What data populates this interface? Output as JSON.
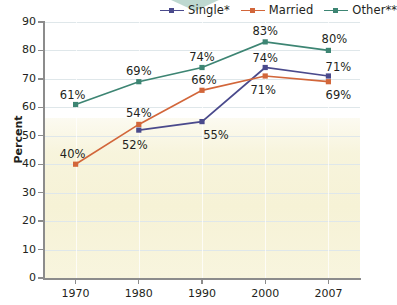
{
  "chart_data": {
    "type": "line",
    "title": "",
    "xlabel": "",
    "ylabel": "Percent",
    "categories": [
      "1970",
      "1980",
      "1990",
      "2000",
      "2007"
    ],
    "ylim": [
      0,
      90
    ],
    "ytick_step": 10,
    "yticks": [
      "0",
      "10",
      "20",
      "30",
      "40",
      "50",
      "60",
      "70",
      "80",
      "90"
    ],
    "grid": true,
    "legend_position": "top",
    "series": [
      {
        "name": "Single*",
        "color": "#4a4a8c",
        "marker": "square",
        "values": [
          null,
          52,
          55,
          74,
          71
        ],
        "labels": [
          "",
          "52%",
          "55%",
          "74%",
          "71%"
        ]
      },
      {
        "name": "Married",
        "color": "#d2663a",
        "marker": "square",
        "values": [
          40,
          54,
          66,
          71,
          69
        ],
        "labels": [
          "40%",
          "54%",
          "66%",
          "71%",
          "69%"
        ]
      },
      {
        "name": "Other**",
        "color": "#3d8573",
        "marker": "square",
        "values": [
          61,
          69,
          74,
          83,
          80
        ],
        "labels": [
          "61%",
          "69%",
          "74%",
          "83%",
          "80%"
        ]
      }
    ]
  },
  "legend": {
    "items": [
      {
        "label": "Single*",
        "color": "#4a4a8c"
      },
      {
        "label": "Married",
        "color": "#d2663a"
      },
      {
        "label": "Other**",
        "color": "#3d8573"
      }
    ]
  },
  "axis": {
    "y_title": "Percent"
  },
  "decor": {
    "chevron_color": "#a8cbc0",
    "chevron_name": "chevron-down-shape"
  }
}
